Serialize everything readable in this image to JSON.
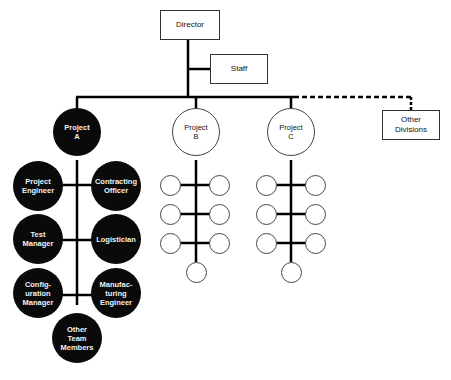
{
  "diagram": {
    "type": "org-chart",
    "director": {
      "label": "Director"
    },
    "staff": {
      "label": "Staff"
    },
    "other_divisions": {
      "label": "Other\nDivisions",
      "connector": "dashed"
    },
    "projects": [
      {
        "label": "Project\nA",
        "style": "filled",
        "team": [
          {
            "label": "Project\nEngineer"
          },
          {
            "label": "Contracting\nOfficer"
          },
          {
            "label": "Test\nManager"
          },
          {
            "label": "Logistician"
          },
          {
            "label": "Config-\nuration\nManager"
          },
          {
            "label": "Manufac-\nturing\nEngineer"
          },
          {
            "label": "Other\nTeam\nMembers"
          }
        ]
      },
      {
        "label": "Project\nB",
        "style": "outline",
        "team_count": 7
      },
      {
        "label": "Project\nC",
        "style": "outline",
        "team_count": 7
      }
    ]
  },
  "colors": {
    "line": "#000000",
    "filled_node": "#0a0a0a",
    "filled_text": "#f2f2f2",
    "outline": "#444444"
  }
}
